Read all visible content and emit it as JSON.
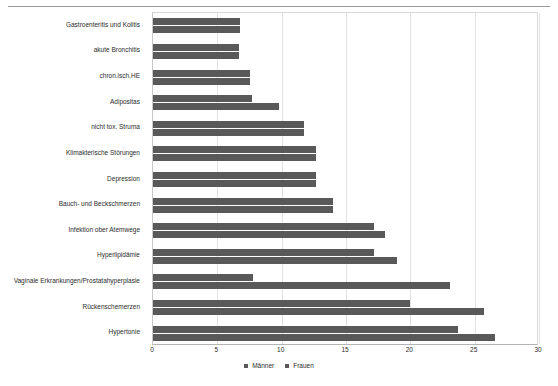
{
  "chart_data": {
    "type": "bar",
    "orientation": "horizontal",
    "title": "",
    "subtitle": "",
    "xlabel": "",
    "ylabel": "",
    "xlim": [
      0,
      30
    ],
    "xticks": [
      "0",
      "5",
      "10",
      "15",
      "20",
      "25",
      "30"
    ],
    "grid": true,
    "grid_axis": "x",
    "legend_position": "bottom-center",
    "categories": [
      "Gastroenteritis und Kolitis",
      "akute Bronchitis",
      "chron.isch.HE",
      "Adipositas",
      "nicht tox. Struma",
      "Klimakterische Störungen",
      "Depression",
      "Bauch- und Beckschmerzen",
      "Infektion ober Atemwege",
      "Hyperlipidämie",
      "Vaginale Erkrankungen/Prostatahyperplasie",
      "Rückenschemerzen",
      "Hypertonie"
    ],
    "series": [
      {
        "name": "Männer",
        "color": "#595959",
        "values": [
          6.8,
          6.7,
          7.5,
          7.7,
          11.7,
          12.7,
          12.7,
          14.0,
          17.2,
          17.2,
          7.8,
          20.0,
          23.7
        ]
      },
      {
        "name": "Frauen",
        "color": "#595959",
        "values": [
          6.8,
          6.7,
          7.5,
          9.8,
          11.7,
          12.7,
          12.7,
          14.0,
          18.0,
          19.0,
          23.1,
          25.7,
          26.6
        ]
      }
    ]
  },
  "legend": {
    "items": [
      {
        "label": "Männer",
        "color": "#595959"
      },
      {
        "label": "Frauen",
        "color": "#595959"
      }
    ]
  }
}
